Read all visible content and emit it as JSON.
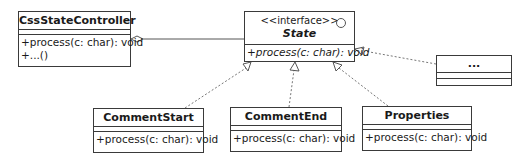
{
  "classes": {
    "controller": {
      "name": "CssStateController",
      "operations": [
        "+process(c: char): void",
        "+...()"
      ]
    },
    "state": {
      "stereotype": "<<interface>>",
      "name": "State",
      "operations": [
        "+process(c: char): void"
      ]
    },
    "others": {
      "name": "..."
    },
    "comment_start": {
      "name": "CommentStart",
      "operations": [
        "+process(c: char): void"
      ]
    },
    "comment_end": {
      "name": "CommentEnd",
      "operations": [
        "+process(c: char): void"
      ]
    },
    "properties": {
      "name": "Properties",
      "operations": [
        "+process(c: char): void"
      ]
    }
  },
  "relationships": [
    {
      "type": "aggregation",
      "from": "CssStateController",
      "to": "State"
    },
    {
      "type": "realization",
      "from": "CommentStart",
      "to": "State"
    },
    {
      "type": "realization",
      "from": "CommentEnd",
      "to": "State"
    },
    {
      "type": "realization",
      "from": "Properties",
      "to": "State"
    },
    {
      "type": "realization",
      "from": "...",
      "to": "State"
    }
  ]
}
